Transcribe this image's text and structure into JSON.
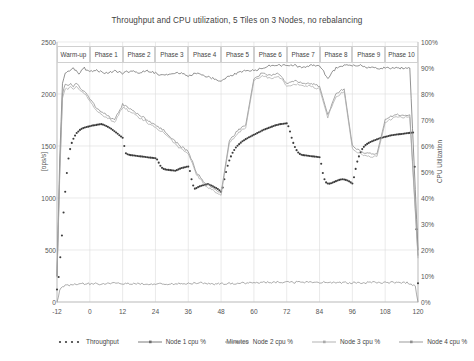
{
  "chart_data": {
    "type": "line",
    "title": "Throughput and CPU utilization, 5 Tiles on 3 Nodes, no rebalancing",
    "xlabel": "Minutes",
    "ylabel": "[ops/s]",
    "ylabel_right": "CPU Utilization",
    "xlim": [
      -12,
      120
    ],
    "ylim": [
      0,
      2500
    ],
    "ylim_right": [
      0,
      100
    ],
    "xticks": [
      -12,
      0,
      12,
      24,
      36,
      48,
      60,
      72,
      84,
      96,
      108,
      120
    ],
    "xtick_labels": [
      "-12",
      "0",
      "12",
      "24",
      "36",
      "48",
      "60",
      "72",
      "84",
      "96",
      "108",
      "120"
    ],
    "yticks": [
      0,
      500,
      1000,
      1500,
      2000,
      2500
    ],
    "ytick_labels": [
      "0",
      "500",
      "1000",
      "1500",
      "2000",
      "2500"
    ],
    "yticks_right": [
      0,
      10,
      20,
      30,
      40,
      50,
      60,
      70,
      80,
      90,
      100
    ],
    "ytick_labels_right": [
      "0%",
      "10%",
      "20%",
      "30%",
      "40%",
      "50%",
      "60%",
      "70%",
      "80%",
      "90%",
      "100%"
    ],
    "grid": true,
    "legend_position": "bottom",
    "phases": [
      {
        "label": "Warm-up",
        "x_start": -12,
        "x_end": 0
      },
      {
        "label": "Phase 1",
        "x_start": 0,
        "x_end": 12
      },
      {
        "label": "Phase 2",
        "x_start": 12,
        "x_end": 24
      },
      {
        "label": "Phase 3",
        "x_start": 24,
        "x_end": 36
      },
      {
        "label": "Phase 4",
        "x_start": 36,
        "x_end": 48
      },
      {
        "label": "Phase 5",
        "x_start": 48,
        "x_end": 60
      },
      {
        "label": "Phase 6",
        "x_start": 60,
        "x_end": 72
      },
      {
        "label": "Phase 7",
        "x_start": 72,
        "x_end": 84
      },
      {
        "label": "Phase 8",
        "x_start": 84,
        "x_end": 96
      },
      {
        "label": "Phase 9",
        "x_start": 96,
        "x_end": 108
      },
      {
        "label": "Phase 10",
        "x_start": 108,
        "x_end": 120
      }
    ],
    "series": [
      {
        "name": "Throughput",
        "axis": "left",
        "style": "dotted",
        "color": "#3c3c3c",
        "x": [
          -12,
          -11.4,
          -10.8,
          -10.2,
          -9.6,
          -9,
          -8.4,
          -7.8,
          -7.2,
          -6.6,
          -6,
          -5.4,
          -4.8,
          -4.2,
          -3.6,
          -3,
          -2.4,
          -1.8,
          -1.2,
          -0.6,
          0,
          0.6,
          1.2,
          1.8,
          2.4,
          3,
          3.6,
          4.2,
          4.8,
          5.4,
          6,
          6.6,
          7.2,
          7.8,
          8.4,
          9,
          9.6,
          10.2,
          10.8,
          11.4,
          12,
          12.6,
          13.2,
          13.8,
          14.4,
          15,
          15.6,
          16.2,
          16.8,
          17.4,
          18,
          18.6,
          19.2,
          19.8,
          20.4,
          21,
          21.6,
          22.2,
          22.8,
          23.4,
          24,
          24.6,
          25.2,
          25.8,
          26.4,
          27,
          27.6,
          28.2,
          28.8,
          29.4,
          30,
          30.6,
          31.2,
          31.8,
          32.4,
          33,
          33.6,
          34.2,
          34.8,
          35.4,
          36,
          36.6,
          37.2,
          37.8,
          38.4,
          39,
          39.6,
          40.2,
          40.8,
          41.4,
          42,
          42.6,
          43.2,
          43.8,
          44.4,
          45,
          45.6,
          46.2,
          46.8,
          47.4,
          48,
          48.6,
          49.2,
          49.8,
          50.4,
          51,
          51.6,
          52.2,
          52.8,
          53.4,
          54,
          54.6,
          55.2,
          55.8,
          56.4,
          57,
          57.6,
          58.2,
          58.8,
          59.4,
          60,
          60.6,
          61.2,
          61.8,
          62.4,
          63,
          63.6,
          64.2,
          64.8,
          65.4,
          66,
          66.6,
          67.2,
          67.8,
          68.4,
          69,
          69.6,
          70.2,
          70.8,
          71.4,
          72,
          72.6,
          73.2,
          73.8,
          74.4,
          75,
          75.6,
          76.2,
          76.8,
          77.4,
          78,
          78.6,
          79.2,
          79.8,
          80.4,
          81,
          81.6,
          82.2,
          82.8,
          83.4,
          84,
          84.6,
          85.2,
          85.8,
          86.4,
          87,
          87.6,
          88.2,
          88.8,
          89.4,
          90,
          90.6,
          91.2,
          91.8,
          92.4,
          93,
          93.6,
          94.2,
          94.8,
          95.4,
          96,
          96.6,
          97.2,
          97.8,
          98.4,
          99,
          99.6,
          100.2,
          100.8,
          101.4,
          102,
          102.6,
          103.2,
          103.8,
          104.4,
          105,
          105.6,
          106.2,
          106.8,
          107.4,
          108,
          108.6,
          109.2,
          109.8,
          110.4,
          111,
          111.6,
          112.2,
          112.8,
          113.4,
          114,
          114.6,
          115.2,
          115.8,
          116.4,
          117,
          117.6,
          118.2,
          118.8,
          119.4,
          120
        ],
        "y": [
          120,
          240,
          430,
          640,
          860,
          1060,
          1240,
          1380,
          1470,
          1530,
          1570,
          1600,
          1625,
          1640,
          1655,
          1665,
          1672,
          1678,
          1682,
          1686,
          1690,
          1694,
          1698,
          1700,
          1703,
          1706,
          1708,
          1710,
          1706,
          1700,
          1692,
          1684,
          1676,
          1666,
          1654,
          1642,
          1630,
          1618,
          1604,
          1592,
          1580,
          1500,
          1430,
          1420,
          1415,
          1412,
          1410,
          1408,
          1406,
          1404,
          1402,
          1400,
          1398,
          1396,
          1394,
          1392,
          1390,
          1388,
          1386,
          1384,
          1382,
          1370,
          1340,
          1310,
          1290,
          1280,
          1275,
          1272,
          1270,
          1268,
          1266,
          1264,
          1262,
          1268,
          1275,
          1282,
          1288,
          1292,
          1296,
          1300,
          1302,
          1260,
          1180,
          1120,
          1090,
          1095,
          1105,
          1112,
          1118,
          1122,
          1126,
          1130,
          1134,
          1128,
          1120,
          1112,
          1104,
          1096,
          1086,
          1074,
          1060,
          1100,
          1180,
          1250,
          1310,
          1360,
          1400,
          1435,
          1462,
          1485,
          1502,
          1518,
          1532,
          1545,
          1556,
          1566,
          1575,
          1584,
          1592,
          1600,
          1608,
          1616,
          1624,
          1632,
          1640,
          1648,
          1656,
          1662,
          1668,
          1674,
          1680,
          1686,
          1692,
          1698,
          1702,
          1706,
          1710,
          1712,
          1714,
          1716,
          1718,
          1690,
          1640,
          1580,
          1530,
          1490,
          1460,
          1438,
          1424,
          1416,
          1412,
          1410,
          1408,
          1406,
          1404,
          1402,
          1400,
          1398,
          1396,
          1394,
          1392,
          1330,
          1240,
          1180,
          1150,
          1140,
          1138,
          1142,
          1148,
          1155,
          1162,
          1168,
          1174,
          1178,
          1180,
          1178,
          1174,
          1168,
          1160,
          1150,
          1140,
          1200,
          1280,
          1350,
          1400,
          1440,
          1470,
          1492,
          1508,
          1520,
          1530,
          1538,
          1546,
          1552,
          1558,
          1564,
          1570,
          1576,
          1580,
          1584,
          1588,
          1592,
          1596,
          1600,
          1604,
          1606,
          1608,
          1610,
          1612,
          1614,
          1616,
          1618,
          1620,
          1622,
          1624,
          1626,
          1628,
          1630,
          1300,
          700,
          180
        ]
      },
      {
        "name": "Node 1 cpu %",
        "axis": "right",
        "style": "solid",
        "color": "#6e6e6e",
        "x": [
          -12,
          -11,
          -10,
          -9,
          -8,
          -7,
          -6,
          -5,
          -4,
          -3,
          -2,
          -1,
          0,
          3,
          6,
          9,
          12,
          15,
          18,
          21,
          24,
          27,
          30,
          33,
          36,
          39,
          42,
          45,
          48,
          51,
          54,
          57,
          60,
          63,
          66,
          69,
          72,
          75,
          78,
          81,
          84,
          87,
          90,
          93,
          96,
          99,
          102,
          105,
          108,
          111,
          114,
          117,
          120
        ],
        "y": [
          10,
          55,
          84,
          88,
          89,
          89,
          90,
          89,
          88,
          89,
          90,
          89,
          89,
          89,
          88,
          89,
          88,
          89,
          88,
          89,
          88,
          87,
          88,
          88,
          87,
          88,
          87,
          86,
          85,
          87,
          88,
          89,
          89,
          90,
          91,
          91,
          91,
          91,
          90,
          91,
          91,
          86,
          90,
          91,
          91,
          91,
          90,
          90,
          90,
          90,
          90,
          90,
          20
        ]
      },
      {
        "name": "Node 2 cpu %",
        "axis": "right",
        "style": "solid",
        "color": "#8a8a8a",
        "x": [
          -12,
          -11,
          -10,
          -9,
          -8,
          -7,
          -6,
          -5,
          -4,
          -3,
          -2,
          -1,
          0,
          3,
          6,
          9,
          12,
          15,
          18,
          21,
          24,
          27,
          30,
          33,
          36,
          39,
          42,
          45,
          48,
          51,
          54,
          57,
          60,
          63,
          66,
          69,
          72,
          75,
          78,
          81,
          84,
          87,
          90,
          93,
          96,
          99,
          102,
          105,
          108,
          111,
          114,
          117,
          120
        ],
        "y": [
          10,
          50,
          80,
          84,
          83,
          84,
          83,
          84,
          83,
          82,
          81,
          80,
          78,
          74,
          72,
          70,
          76,
          74,
          72,
          70,
          68,
          66,
          63,
          60,
          58,
          50,
          46,
          44,
          42,
          62,
          66,
          68,
          86,
          88,
          87,
          88,
          84,
          85,
          84,
          84,
          83,
          72,
          80,
          82,
          60,
          58,
          57,
          57,
          70,
          72,
          72,
          72,
          18
        ]
      },
      {
        "name": "Node 3 cpu %",
        "axis": "right",
        "style": "solid",
        "color": "#aaaaaa",
        "x": [
          -12,
          -11,
          -10,
          -9,
          -8,
          -7,
          -6,
          -5,
          -4,
          -3,
          -2,
          -1,
          0,
          3,
          6,
          9,
          12,
          15,
          18,
          21,
          24,
          27,
          30,
          33,
          36,
          39,
          42,
          45,
          48,
          51,
          54,
          57,
          60,
          63,
          66,
          69,
          72,
          75,
          78,
          81,
          84,
          87,
          90,
          93,
          96,
          99,
          102,
          105,
          108,
          111,
          114,
          117,
          120
        ],
        "y": [
          10,
          48,
          78,
          82,
          82,
          83,
          82,
          83,
          82,
          81,
          80,
          79,
          77,
          73,
          71,
          69,
          75,
          73,
          71,
          69,
          67,
          65,
          62,
          59,
          57,
          49,
          45,
          43,
          41,
          61,
          65,
          67,
          85,
          87,
          86,
          87,
          83,
          84,
          83,
          83,
          82,
          71,
          79,
          81,
          59,
          57,
          56,
          56,
          69,
          71,
          71,
          71,
          17
        ]
      },
      {
        "name": "Node 4 cpu %",
        "axis": "right",
        "style": "solid",
        "color": "#909090",
        "x": [
          -12,
          -11.5,
          -11,
          -10,
          -9,
          -8,
          -7,
          -6,
          -5,
          -4,
          -3,
          -2,
          -1,
          0,
          4,
          8,
          12,
          16,
          20,
          24,
          28,
          32,
          36,
          40,
          44,
          48,
          52,
          56,
          60,
          64,
          68,
          72,
          76,
          80,
          84,
          88,
          92,
          96,
          100,
          104,
          108,
          112,
          116,
          119,
          120
        ],
        "y": [
          0,
          2,
          5,
          6,
          6.3,
          6.5,
          6.6,
          6.7,
          6.8,
          6.9,
          6.9,
          7,
          7,
          7,
          7,
          7.1,
          7.1,
          7,
          7,
          7,
          7,
          7.1,
          7.1,
          7.3,
          7,
          7,
          7.2,
          7.3,
          7.4,
          7.5,
          7.6,
          7.6,
          7.6,
          7.6,
          7.5,
          7.5,
          7.4,
          7.4,
          7.4,
          7.5,
          7.4,
          7.5,
          7.4,
          6,
          0
        ]
      }
    ]
  },
  "legend": [
    {
      "label": "Throughput",
      "style": "dotted"
    },
    {
      "label": "Node 1 cpu %",
      "style": "solid"
    },
    {
      "label": "Node 2 cpu %",
      "style": "solid"
    },
    {
      "label": "Node 3 cpu %",
      "style": "solid"
    },
    {
      "label": "Node 4 cpu %",
      "style": "solid"
    }
  ]
}
